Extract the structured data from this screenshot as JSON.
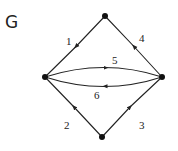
{
  "title": "G",
  "colors": {
    "line": "#222222",
    "node": "#111111",
    "background": "#ffffff"
  },
  "nodes": [
    {
      "id": "top",
      "x": 105,
      "y": 16
    },
    {
      "id": "left",
      "x": 45,
      "y": 77
    },
    {
      "id": "right",
      "x": 162,
      "y": 77
    },
    {
      "id": "bottom",
      "x": 102,
      "y": 137
    }
  ],
  "edges": [
    {
      "label": "1",
      "from": "top",
      "to": "left"
    },
    {
      "label": "2",
      "from": "bottom",
      "to": "left"
    },
    {
      "label": "3",
      "from": "bottom",
      "to": "right"
    },
    {
      "label": "4",
      "from": "right",
      "to": "top"
    },
    {
      "label": "5",
      "from": "left",
      "to": "right"
    },
    {
      "label": "6",
      "from": "right",
      "to": "left"
    }
  ]
}
